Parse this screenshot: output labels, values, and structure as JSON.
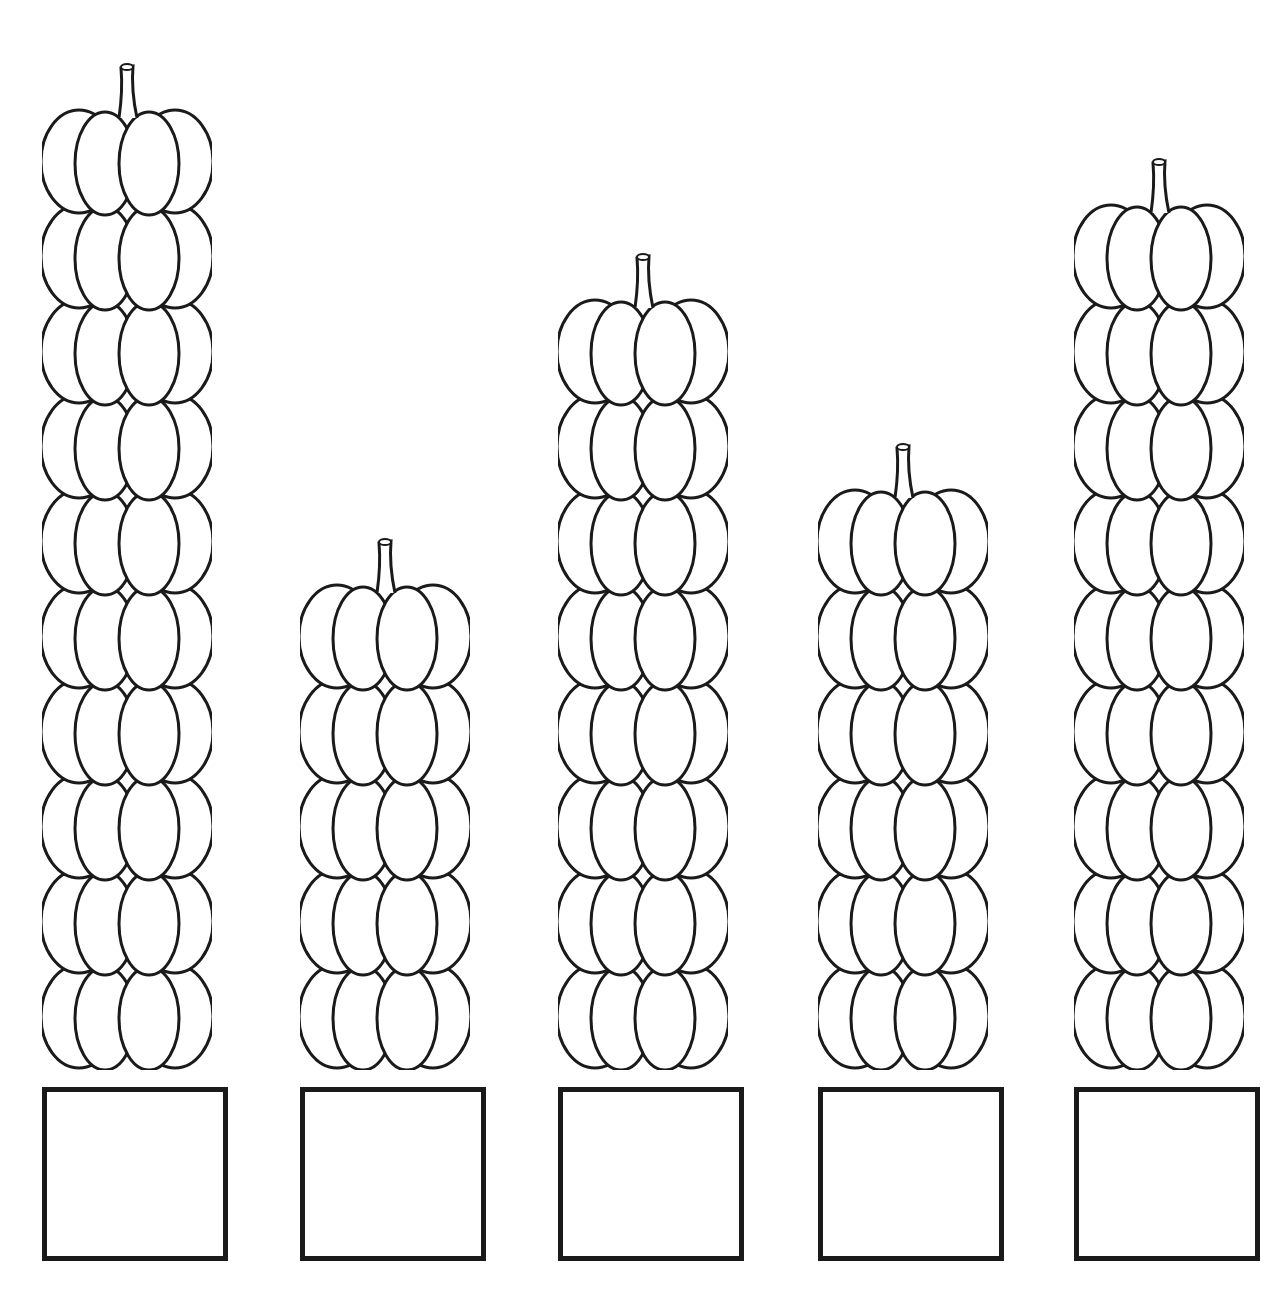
{
  "worksheet": {
    "type": "counting-pumpkins",
    "stacks": [
      {
        "count": 10,
        "answer": ""
      },
      {
        "count": 5,
        "answer": ""
      },
      {
        "count": 8,
        "answer": ""
      },
      {
        "count": 6,
        "answer": ""
      },
      {
        "count": 9,
        "answer": ""
      }
    ]
  },
  "colors": {
    "line": "#1a1a1a",
    "background": "#ffffff"
  }
}
